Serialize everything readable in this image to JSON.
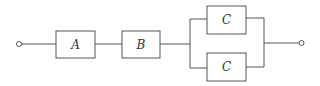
{
  "diagram": {
    "type": "series-parallel block diagram",
    "blocks": [
      {
        "id": "A",
        "label": "A"
      },
      {
        "id": "B",
        "label": "B"
      },
      {
        "id": "C1",
        "label": "C"
      },
      {
        "id": "C2",
        "label": "C"
      }
    ],
    "terminals": [
      "input",
      "output"
    ],
    "connections": [
      "input -> A",
      "A -> B",
      "B -> (C1 || C2)",
      "(C1 || C2) -> output"
    ],
    "line_color": "#555555"
  }
}
